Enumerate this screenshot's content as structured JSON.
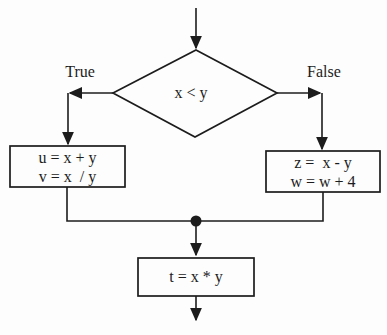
{
  "flowchart": {
    "decision": {
      "label": "x < y"
    },
    "branch_true": {
      "label": "True"
    },
    "branch_false": {
      "label": "False"
    },
    "true_box": {
      "line1": "u = x + y",
      "line2": "v = x  / y"
    },
    "false_box": {
      "line1": "z =  x - y",
      "line2": "w = w + 4"
    },
    "merge_box": {
      "label": "t = x * y"
    },
    "colors": {
      "line": "#1c1c1c",
      "background": "#fdfdfd"
    }
  }
}
